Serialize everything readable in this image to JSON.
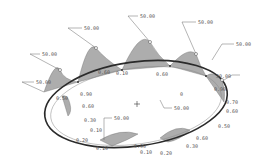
{
  "diagram": {
    "type": "variable-section-sweep-graph",
    "colors": {
      "ring": "#2a2a2a",
      "shading": "#a9a9a9",
      "leader": "#6a6a6a",
      "text": "#555555"
    },
    "large_dims": [
      {
        "id": "d1",
        "value": "50.00"
      },
      {
        "id": "d2",
        "value": "50.00"
      },
      {
        "id": "d3",
        "value": "50.00"
      },
      {
        "id": "d4",
        "value": "50.00"
      },
      {
        "id": "d5",
        "value": "50.00"
      },
      {
        "id": "d6",
        "value": "50.00"
      },
      {
        "id": "d7",
        "value": "50.00"
      },
      {
        "id": "d8",
        "value": "50.00"
      },
      {
        "id": "d9",
        "value": "50.00"
      }
    ],
    "small_dims": [
      {
        "id": "s1",
        "value": "0.10"
      },
      {
        "id": "s2",
        "value": "0.60"
      },
      {
        "id": "s3",
        "value": "0.60"
      },
      {
        "id": "s4",
        "value": "0.90"
      },
      {
        "id": "s5",
        "value": "0.50"
      },
      {
        "id": "s6",
        "value": "0.60"
      },
      {
        "id": "s7",
        "value": "0.90"
      },
      {
        "id": "s8",
        "value": "0.70"
      },
      {
        "id": "s9",
        "value": "0.60"
      },
      {
        "id": "s10",
        "value": "0.50"
      },
      {
        "id": "s11",
        "value": "0.60"
      },
      {
        "id": "s12",
        "value": "0.30"
      },
      {
        "id": "s13",
        "value": "0.20"
      },
      {
        "id": "s14",
        "value": "0.10"
      },
      {
        "id": "s15",
        "value": "0.90"
      },
      {
        "id": "s16",
        "value": "0.30"
      },
      {
        "id": "s17",
        "value": "0.10"
      },
      {
        "id": "s18",
        "value": "0.20"
      },
      {
        "id": "s19",
        "value": "0.10"
      },
      {
        "id": "s20",
        "value": "0"
      }
    ]
  }
}
